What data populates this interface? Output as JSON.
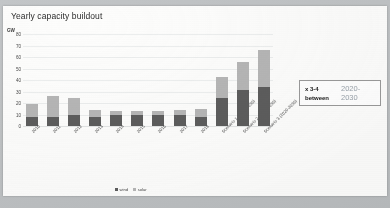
{
  "slide": {
    "title": "Yearly capacity buildout"
  },
  "callout": {
    "line1_left": "x 3-4",
    "line1_right": "2020-",
    "line2_left": "between",
    "line2_right": "2030"
  },
  "legend": {
    "items": [
      {
        "label": "wind",
        "color": "#5d5d5d"
      },
      {
        "label": "solar",
        "color": "#b6b6b6"
      }
    ]
  },
  "chart_data": {
    "type": "bar",
    "title": "Yearly capacity buildout",
    "xlabel": "",
    "ylabel": "GW",
    "unit": "GW",
    "stacked": true,
    "grid": true,
    "legend_position": "bottom",
    "ylim": [
      0,
      80
    ],
    "yticks": [
      80,
      70,
      60,
      50,
      40,
      30,
      20,
      10,
      0
    ],
    "ytick_labels": [
      "80",
      "70",
      "60",
      "50",
      "40",
      "30",
      "20",
      "10",
      "0"
    ],
    "categories": [
      "2010",
      "2011",
      "2012",
      "2013",
      "2014",
      "2015",
      "2016",
      "2017",
      "2018",
      "Scenario 1 (2020-2030)",
      "Scenario 2 (2020-2030)",
      "Scenario 3 (2020-2030)"
    ],
    "series": [
      {
        "name": "wind",
        "color": "#5d5d5d",
        "values": [
          8,
          8,
          10,
          8,
          10,
          10,
          10,
          10,
          8,
          24,
          31,
          34
        ]
      },
      {
        "name": "solar",
        "color": "#b6b6b6",
        "values": [
          11,
          18,
          14,
          6,
          3,
          3,
          3,
          4,
          7,
          19,
          25,
          32
        ]
      }
    ],
    "totals": [
      19,
      26,
      24,
      14,
      13,
      13,
      13,
      14,
      15,
      43,
      56,
      66
    ],
    "annotations": [
      {
        "text": "x 3-4 between",
        "text2": "2020-2030"
      }
    ]
  }
}
